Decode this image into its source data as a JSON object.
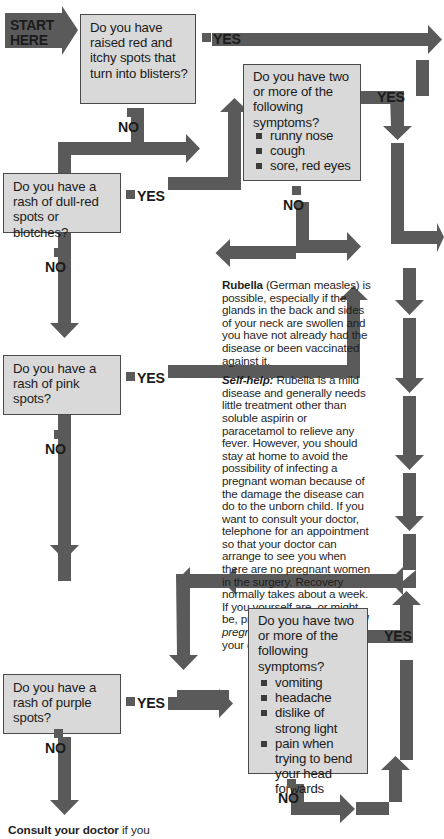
{
  "start": {
    "line1": "START",
    "line2": "HERE"
  },
  "labels": {
    "yes": "YES",
    "no": "NO"
  },
  "colors": {
    "box_fill": "#d9d9d9",
    "box_border": "#4a4a4a",
    "arrow": "#5a5a5a",
    "text": "#1b1b1b",
    "page_bg": "#ffffff"
  },
  "questions": [
    {
      "id": "q-blisters",
      "text": "Do you have raised red and itchy spots that turn into blisters?",
      "yes": "YES",
      "no": "NO"
    },
    {
      "id": "q-dull-red",
      "text": "Do you have a rash of dull-red spots or blotches?",
      "yes": "YES",
      "no": "NO"
    },
    {
      "id": "q-cold-symptoms",
      "text": "Do you have two or more of the following symptoms?",
      "bullets": [
        "runny nose",
        "cough",
        "sore, red eyes"
      ],
      "yes": "YES",
      "no": "NO"
    },
    {
      "id": "q-pink",
      "text": "Do you have a rash of pink spots?",
      "yes": "YES",
      "no": "NO"
    },
    {
      "id": "q-purple",
      "text": "Do you have a rash of purple spots?",
      "yes": "YES",
      "no": "NO"
    },
    {
      "id": "q-meningitis",
      "text": "Do you have two or more of the following symptoms?",
      "bullets": [
        "vomiting",
        "headache",
        "dislike of strong light",
        "pain when trying to bend your head forwards"
      ],
      "yes": "YES",
      "no": "NO"
    }
  ],
  "article": {
    "heading": "Rubella",
    "lead": "(German measles) is possible, especially if the glands in the back and sides of your neck are swollen and you have not already had the disease or been vaccinated against it.",
    "selfhelp_label": "Self-help:",
    "selfhelp_part1": "Rubella is a mild disease and generally needs little treatment other than soluble aspirin or paracetamol to relieve any fever. However, you should stay at home to avoid the possibility of infecting a pregnant woman because of the damage the disease can do to the unborn child. If you want to consult your doctor, telephone for an appointment so that your doctor can arrange to see you when there are no pregnant women in the surgery. Recovery normally takes about a week. If you yourself are, or might be, pregnant, see ",
    "selfhelp_italic": "rubella and pregnancy",
    "selfhelp_part2": " (right) and consult your doctor."
  },
  "footer": {
    "bold": "Consult your doctor",
    "rest": " if you"
  }
}
